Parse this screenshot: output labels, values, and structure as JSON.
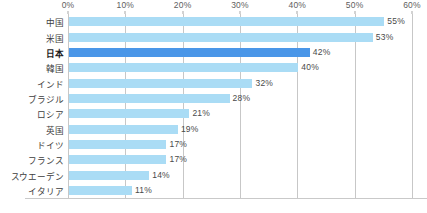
{
  "chart_data": {
    "type": "bar",
    "orientation": "horizontal",
    "title": "",
    "xlabel": "",
    "ylabel": "",
    "xlim": [
      0,
      60
    ],
    "xticks": [
      "0%",
      "10%",
      "20%",
      "30%",
      "40%",
      "50%",
      "60%"
    ],
    "xtick_values": [
      0,
      10,
      20,
      30,
      40,
      50,
      60
    ],
    "grid": "vertical",
    "legend": "none",
    "categories": [
      "中国",
      "米国",
      "日本",
      "韓国",
      "インド",
      "ブラジル",
      "ロシア",
      "英国",
      "ドイツ",
      "フランス",
      "スウエーデン",
      "イタリア"
    ],
    "values": [
      55,
      53,
      42,
      40,
      32,
      28,
      21,
      19,
      17,
      17,
      14,
      11
    ],
    "value_labels": [
      "55%",
      "53%",
      "42%",
      "40%",
      "32%",
      "28%",
      "21%",
      "19%",
      "17%",
      "17%",
      "14%",
      "11%"
    ],
    "highlight_index": 2,
    "colors": {
      "bar": "#aadcf5",
      "bar_highlight": "#4a96e8",
      "gridline": "#c7c7c7",
      "axis": "#b9b9b9",
      "text": "#4a4a4a",
      "background": "#ffffff"
    }
  }
}
